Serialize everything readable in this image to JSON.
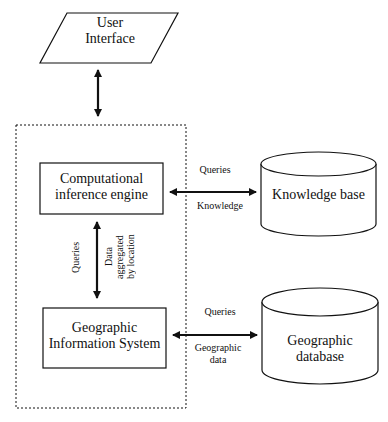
{
  "diagram": {
    "type": "system-architecture-flowchart",
    "nodes": {
      "user_interface": "User Interface",
      "user_interface_lines": [
        "User",
        "Interface"
      ],
      "inference_engine_lines": [
        "Computational",
        "inference engine"
      ],
      "knowledge_base": "Knowledge base",
      "gis_lines": [
        "Geographic",
        "Information System"
      ],
      "geo_db_lines": [
        "Geographic",
        "database"
      ]
    },
    "edges": {
      "engine_kb_top": "Queries",
      "engine_kb_bottom": "Knowledge",
      "engine_gis_left": "Queries",
      "engine_gis_right_lines": [
        "Data",
        "aggregated",
        "by location"
      ],
      "gis_db_top": "Queries",
      "gis_db_bottom_lines": [
        "Geographic",
        "data"
      ]
    },
    "colors": {
      "stroke": "#111111",
      "background": "#ffffff"
    }
  }
}
